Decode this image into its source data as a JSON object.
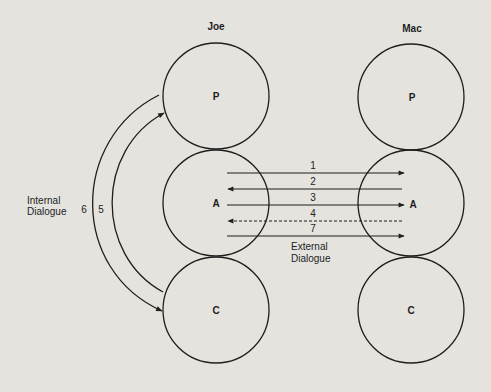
{
  "persons": [
    {
      "name": "Joe",
      "center_x": 216,
      "states": [
        {
          "label": "P",
          "cy": 96
        },
        {
          "label": "A",
          "cy": 203
        },
        {
          "label": "C",
          "cy": 310
        }
      ]
    },
    {
      "name": "Mac",
      "center_x": 411,
      "states": [
        {
          "label": "P",
          "cy": 97
        },
        {
          "label": "A",
          "cy": 203
        },
        {
          "label": "C",
          "cy": 310
        }
      ]
    }
  ],
  "internal_dialogue": {
    "label_line1": "Internal",
    "label_line2": "Dialogue",
    "arcs": [
      {
        "number": "6",
        "from": "P",
        "to": "C",
        "direction": "down"
      },
      {
        "number": "5",
        "from": "C",
        "to": "P",
        "direction": "up"
      }
    ]
  },
  "external_dialogue": {
    "label_line1": "External",
    "label_line2": "Dialogue",
    "transactions": [
      {
        "number": "1",
        "direction": "right",
        "style": "solid"
      },
      {
        "number": "2",
        "direction": "left",
        "style": "solid"
      },
      {
        "number": "3",
        "direction": "right",
        "style": "solid"
      },
      {
        "number": "4",
        "direction": "left",
        "style": "dashed"
      },
      {
        "number": "7",
        "direction": "right",
        "style": "solid"
      }
    ]
  },
  "colors": {
    "background": "#e4e3de",
    "ink": "#1e1e1e"
  }
}
